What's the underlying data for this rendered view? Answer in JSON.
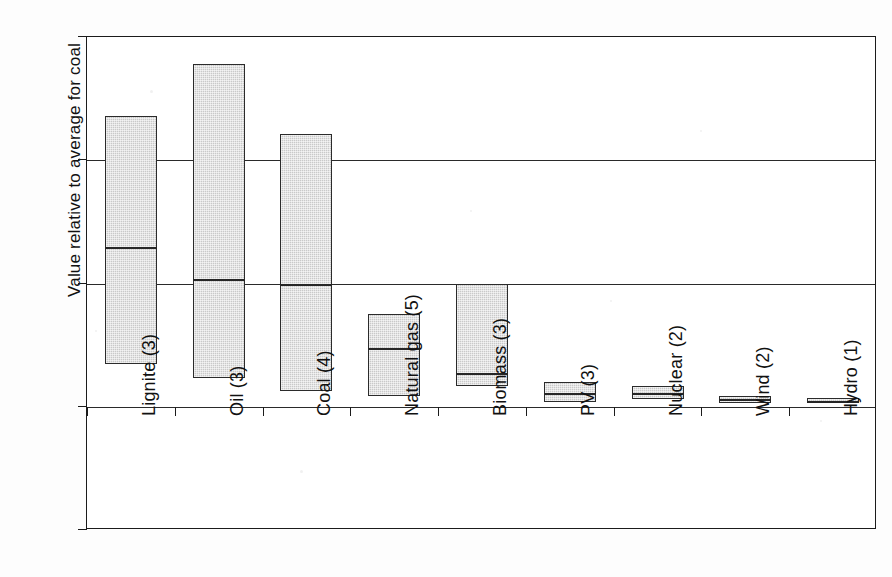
{
  "chart_data": {
    "type": "bar",
    "subtype": "floating-range-bars-with-median",
    "title": "",
    "xlabel": "",
    "ylabel": "Value relative to average for coal",
    "ylim": [
      -1,
      3
    ],
    "yticks": [
      3,
      2,
      1,
      0,
      -1
    ],
    "ytick_labels": [
      "3",
      "2",
      "1",
      "0",
      "-1"
    ],
    "grid": true,
    "grid_axis": "y",
    "legend": "none",
    "categories": [
      "Lignite (3)",
      "Oil (3)",
      "Coal (4)",
      "Natural gas (5)",
      "Biomass (3)",
      "PV (3)",
      "Nuclear (2)",
      "Wind (2)",
      "Hydro (1)"
    ],
    "series": [
      {
        "name": "max",
        "values": [
          2.36,
          2.78,
          2.21,
          0.75,
          1.0,
          0.2,
          0.17,
          0.09,
          0.07
        ]
      },
      {
        "name": "median",
        "values": [
          1.3,
          1.04,
          1.0,
          0.48,
          0.27,
          0.11,
          0.11,
          0.06,
          0.05
        ]
      },
      {
        "name": "min",
        "values": [
          0.35,
          0.23,
          0.13,
          0.09,
          0.17,
          0.04,
          0.06,
          0.03,
          0.03
        ]
      }
    ],
    "bar_style": {
      "fill": "#c9c9c9",
      "edge": "#2b2b2b",
      "median_color": "#262626"
    }
  },
  "axis": {
    "y_title": "Value relative to average for coal"
  },
  "colors": {
    "axis": "#1b1b1b",
    "grid": "#2a2a2a",
    "bar_fill": "#c9c9c9",
    "bar_edge": "#2b2b2b",
    "background": "#ffffff"
  }
}
